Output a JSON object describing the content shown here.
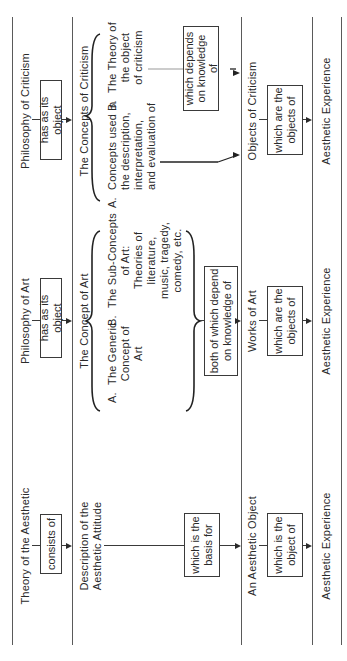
{
  "diagram": {
    "orientation": "rotated-90-ccw",
    "columns": [
      {
        "id": "criticism",
        "theory": "Philosophy of Criticism",
        "relation1": "has as its object",
        "concept": "The Concepts of Criticism",
        "sub_a": [
          "A.",
          "Concepts used in",
          "the description,",
          "interpretation,",
          "and evaluation of"
        ],
        "sub_b": [
          "B.",
          "The Theory of",
          "the object",
          "of criticism"
        ],
        "relation2": [
          "which depends",
          "on knowledge",
          "of"
        ],
        "object": "Objects of Criticism",
        "relation3": [
          "which are the",
          "objects of"
        ],
        "experience": "Aesthetic Experience"
      },
      {
        "id": "art",
        "theory": "Philosophy of Art",
        "relation1": "has as its object",
        "concept": "The Concept of Art",
        "sub_a": [
          "A.",
          "The Generic",
          "Concept of",
          "Art"
        ],
        "sub_b": [
          "B.",
          "The Sub-Concepts",
          "of Art:",
          "Theories of",
          "literature,",
          "music, tragedy,",
          "comedy, etc."
        ],
        "relation2": [
          "both of which depend",
          "on knowledge of"
        ],
        "object": "Works of Art",
        "relation3": [
          "which are the",
          "objects of"
        ],
        "experience": "Aesthetic Experience"
      },
      {
        "id": "aesthetic",
        "theory": "Theory of the Aesthetic",
        "relation1": "consists of",
        "concept": [
          "Description of the",
          "Aesthetic Attitude"
        ],
        "relation2": [
          "which is the",
          "basis for"
        ],
        "object": "An Aesthetic Object",
        "relation3": [
          "which is the",
          "object of"
        ],
        "experience": "Aesthetic Experience"
      }
    ]
  }
}
